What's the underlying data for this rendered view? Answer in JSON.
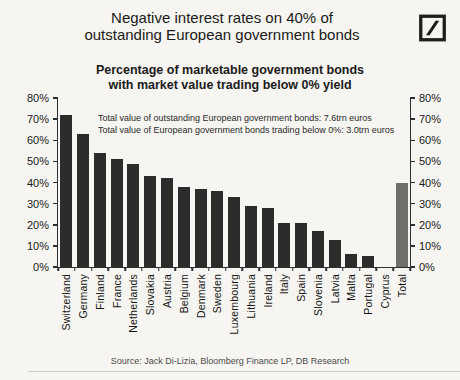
{
  "header": {
    "title_line1": "Negative interest rates on 40% of",
    "title_line2": "outstanding European government bonds",
    "logo": "deutsche-bank-logo"
  },
  "chart_data": {
    "type": "bar",
    "title_line1": "Percentage of marketable government bonds",
    "title_line2": "with market value trading below 0% yield",
    "annotation_line1": "Total value of outstanding European government bonds: 7.6trn euros",
    "annotation_line2": "Total value of European government bonds trading below 0%: 3.0trn euros",
    "categories": [
      "Switzerland",
      "Germany",
      "Finland",
      "France",
      "Netherlands",
      "Slovakia",
      "Austria",
      "Belgium",
      "Denmark",
      "Sweden",
      "Luxembourg",
      "Lithuania",
      "Ireland",
      "Italy",
      "Spain",
      "Slovenia",
      "Latvia",
      "Malta",
      "Portugal",
      "Cyprus",
      "Total"
    ],
    "values": [
      72,
      63,
      54,
      51,
      49,
      43,
      42,
      38,
      37,
      36,
      33,
      29,
      28,
      21,
      21,
      17,
      13,
      6,
      5,
      0,
      40
    ],
    "ylim": [
      0,
      80
    ],
    "y_tick_step": 10,
    "y_tick_suffix": "%",
    "grid": false,
    "legend": "none",
    "axis_sides": "left-and-right",
    "bar_color": "#2d2c2a",
    "total_bar_color": "#6f6e6b",
    "highlight_category": "Total"
  },
  "footer": {
    "source": "Source: Jack Di-Lizia, Bloomberg Finance LP, DB Research"
  }
}
